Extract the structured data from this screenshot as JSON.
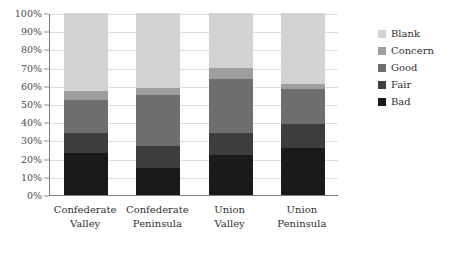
{
  "chart_data": {
    "type": "bar",
    "subtype": "stacked-bar-100-percent",
    "title": "",
    "xlabel": "",
    "ylabel": "",
    "ylim": [
      0,
      100
    ],
    "ytick_labels": [
      "0%",
      "10%",
      "20%",
      "30%",
      "40%",
      "50%",
      "60%",
      "70%",
      "80%",
      "90%",
      "100%"
    ],
    "ytick_values": [
      0,
      10,
      20,
      30,
      40,
      50,
      60,
      70,
      80,
      90,
      100
    ],
    "grid": true,
    "legend_position": "right",
    "categories": [
      "Confederate Valley",
      "Confederate Peninsula",
      "Union Valley",
      "Union Peninsula"
    ],
    "category_lines": [
      [
        "Confederate",
        "Valley"
      ],
      [
        "Confederate",
        "Peninsula"
      ],
      [
        "Union",
        "Valley"
      ],
      [
        "Union",
        "Peninsula"
      ]
    ],
    "series": [
      {
        "name": "Bad",
        "color": "#1a1a1a",
        "values": [
          23,
          15,
          22,
          26
        ]
      },
      {
        "name": "Fair",
        "color": "#3d3d3d",
        "values": [
          11,
          12,
          12,
          13
        ]
      },
      {
        "name": "Good",
        "color": "#6e6e6e",
        "values": [
          18,
          28,
          30,
          19
        ]
      },
      {
        "name": "Concern",
        "color": "#9e9e9e",
        "values": [
          5,
          4,
          6,
          3
        ]
      },
      {
        "name": "Blank",
        "color": "#d3d3d3",
        "values": [
          43,
          41,
          30,
          39
        ]
      }
    ],
    "cumulative_tops": {
      "Confederate Valley": {
        "Bad": 23,
        "Fair": 34,
        "Good": 52,
        "Concern": 57,
        "Blank": 100
      },
      "Confederate Peninsula": {
        "Bad": 15,
        "Fair": 27,
        "Good": 55,
        "Concern": 59,
        "Blank": 100
      },
      "Union Valley": {
        "Bad": 22,
        "Fair": 34,
        "Good": 64,
        "Concern": 70,
        "Blank": 100
      },
      "Union Peninsula": {
        "Bad": 26,
        "Fair": 39,
        "Good": 58,
        "Concern": 61,
        "Blank": 100
      }
    }
  },
  "legend": {
    "entries": [
      {
        "label": "Blank",
        "color": "#d3d3d3"
      },
      {
        "label": "Concern",
        "color": "#9e9e9e"
      },
      {
        "label": "Good",
        "color": "#6e6e6e"
      },
      {
        "label": "Fair",
        "color": "#3d3d3d"
      },
      {
        "label": "Bad",
        "color": "#1a1a1a"
      }
    ]
  },
  "axis": {
    "line_color": "#7d7d7d",
    "grid_color": "#dcdcdc",
    "tick_label_color": "#4a4a4a"
  }
}
